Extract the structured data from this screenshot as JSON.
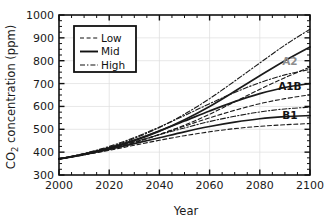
{
  "chart_data": {
    "type": "line",
    "title": "",
    "xlabel": "Year",
    "ylabel": "CO2 concentration (ppm)",
    "ylabel_parts": {
      "pre": "CO",
      "sub": "2",
      "post": " concentration (ppm)"
    },
    "xlim": [
      2000,
      2100
    ],
    "ylim": [
      300,
      1000
    ],
    "xticks": [
      2000,
      2020,
      2040,
      2060,
      2080,
      2100
    ],
    "xtick_labels": [
      "2000",
      "2020",
      "2040",
      "2060",
      "2080",
      "2100"
    ],
    "yticks": [
      300,
      400,
      500,
      600,
      700,
      800,
      900,
      1000
    ],
    "ytick_labels": [
      "300",
      "400",
      "500",
      "600",
      "700",
      "800",
      "900",
      "1000"
    ],
    "x_minor_step": 5,
    "y_minor_step": 25,
    "grid": true,
    "grid_color": "#dcdcdc",
    "legend": {
      "position": "upper-left",
      "entries": [
        {
          "label": "Low",
          "style": "dashed"
        },
        {
          "label": "Mid",
          "style": "solid"
        },
        {
          "label": "High",
          "style": "dashdot"
        }
      ]
    },
    "x": [
      2000,
      2010,
      2020,
      2030,
      2040,
      2050,
      2060,
      2070,
      2080,
      2090,
      2100
    ],
    "scenarios": [
      {
        "name": "A2",
        "label": "A2",
        "label_color": "#8c8c8c",
        "label_x": 2092,
        "label_y": 800,
        "series": [
          {
            "name": "Low",
            "style": "dashed",
            "values": [
              370,
              389,
              412,
              441,
              477,
              518,
              566,
              620,
              675,
              726,
              772
            ]
          },
          {
            "name": "Mid",
            "style": "solid",
            "values": [
              370,
              391,
              417,
              450,
              492,
              542,
              600,
              666,
              734,
              800,
              860
            ]
          },
          {
            "name": "High",
            "style": "dashdot",
            "values": [
              370,
              393,
              422,
              460,
              508,
              566,
              634,
              711,
              790,
              868,
              938
            ]
          }
        ]
      },
      {
        "name": "A1B",
        "label": "A1B",
        "label_color": "#141414",
        "label_x": 2092,
        "label_y": 690,
        "series": [
          {
            "name": "Low",
            "style": "dashed",
            "values": [
              370,
              390,
              414,
              444,
              478,
              514,
              550,
              583,
              612,
              634,
              651
            ]
          },
          {
            "name": "Mid",
            "style": "solid",
            "values": [
              370,
              392,
              419,
              453,
              493,
              536,
              580,
              621,
              656,
              683,
              700
            ]
          },
          {
            "name": "High",
            "style": "dashdot",
            "values": [
              370,
              394,
              425,
              464,
              510,
              560,
              612,
              661,
              704,
              738,
              762
            ]
          }
        ]
      },
      {
        "name": "B1",
        "label": "B1",
        "label_color": "#141414",
        "label_x": 2092,
        "label_y": 562,
        "series": [
          {
            "name": "Low",
            "style": "dashed",
            "values": [
              370,
              388,
              408,
              430,
              452,
              472,
              489,
              503,
              513,
              520,
              525
            ]
          },
          {
            "name": "Mid",
            "style": "solid",
            "values": [
              370,
              389,
              412,
              437,
              463,
              489,
              512,
              531,
              546,
              555,
              560
            ]
          },
          {
            "name": "High",
            "style": "dashdot",
            "values": [
              370,
              391,
              416,
              445,
              476,
              506,
              534,
              557,
              576,
              589,
              597
            ]
          }
        ]
      }
    ]
  }
}
